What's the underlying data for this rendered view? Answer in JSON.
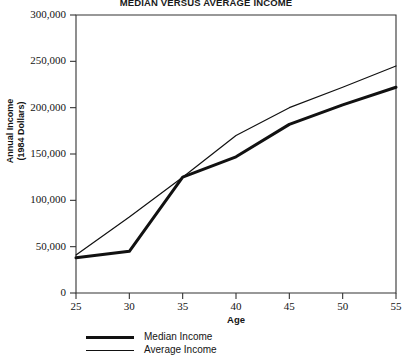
{
  "chart_data": {
    "type": "line",
    "title": "MEDIAN VERSUS AVERAGE INCOME",
    "xlabel": "Age",
    "ylabel": "Annual Income\n(1984  Dollars)",
    "ylabel_line1": "Annual Income",
    "ylabel_line2": "(1984  Dollars)",
    "x": [
      25,
      30,
      35,
      40,
      45,
      50,
      55
    ],
    "xlim": [
      25,
      55
    ],
    "ylim": [
      0,
      300000
    ],
    "xticks": [
      25,
      30,
      35,
      40,
      45,
      50,
      55
    ],
    "xtick_labels": [
      "25",
      "30",
      "35",
      "40",
      "45",
      "50",
      "55"
    ],
    "yticks": [
      0,
      50000,
      100000,
      150000,
      200000,
      250000,
      300000
    ],
    "ytick_labels": [
      "0",
      "50,000",
      "100,000",
      "150,000",
      "200,000",
      "250,000",
      "300,000"
    ],
    "grid": false,
    "legend_position": "below-left",
    "series": [
      {
        "name": "Median Income",
        "values": [
          38000,
          45000,
          125000,
          147000,
          182000,
          203000,
          222000
        ],
        "line_width": 3,
        "color": "#111111"
      },
      {
        "name": "Average Income",
        "values": [
          41000,
          82000,
          125000,
          170000,
          200000,
          222000,
          245000
        ],
        "line_width": 1.2,
        "color": "#111111"
      }
    ]
  },
  "legend": {
    "items": [
      {
        "label": "Median Income",
        "style": "thick"
      },
      {
        "label": "Average Income",
        "style": "thin"
      }
    ]
  },
  "colors": {
    "axis": "#333333",
    "line": "#111111",
    "background": "#ffffff"
  }
}
